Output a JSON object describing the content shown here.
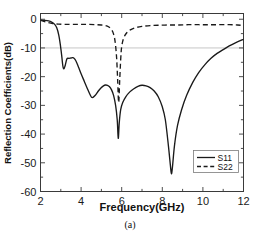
{
  "figure": {
    "caption": "(a)",
    "background": "#ffffff",
    "line_color": "#1a1a1a",
    "grid_color": "#b9b9b9",
    "axis_color": "#3a3a3a"
  },
  "chart_data": {
    "type": "line",
    "title": "",
    "xlabel": "Frequency(GHz)",
    "ylabel": "Reflection Coefficients(dB)",
    "xlim": [
      2,
      12
    ],
    "ylim": [
      -60,
      2
    ],
    "xticks": [
      2,
      4,
      6,
      8,
      10,
      12
    ],
    "xtick_labels": [
      "2",
      "4",
      "6",
      "8",
      "10",
      "12"
    ],
    "xminor_ticks": [
      3,
      5,
      7,
      9,
      11
    ],
    "yticks": [
      0,
      -10,
      -20,
      -30,
      -40,
      -50,
      -60
    ],
    "ytick_labels": [
      "0",
      "-10",
      "-20",
      "-30",
      "-40",
      "-50",
      "-60"
    ],
    "grid": "horizontal-single",
    "gridlines_y": [
      -10
    ],
    "legend_position": "lower right",
    "series": [
      {
        "name": "S11",
        "style": "solid",
        "x": [
          2.0,
          2.2,
          2.4,
          2.55,
          2.7,
          2.8,
          2.9,
          2.98,
          3.05,
          3.1,
          3.15,
          3.22,
          3.3,
          3.4,
          3.5,
          3.6,
          3.7,
          3.8,
          3.9,
          4.0,
          4.15,
          4.3,
          4.45,
          4.55,
          4.7,
          4.85,
          5.0,
          5.1,
          5.2,
          5.3,
          5.4,
          5.5,
          5.6,
          5.7,
          5.78,
          5.83,
          5.88,
          5.95,
          6.05,
          6.2,
          6.4,
          6.6,
          6.8,
          7.0,
          7.2,
          7.4,
          7.6,
          7.8,
          8.0,
          8.15,
          8.3,
          8.4,
          8.45,
          8.5,
          8.6,
          8.75,
          8.95,
          9.2,
          9.5,
          9.8,
          10.1,
          10.4,
          10.7,
          11.0,
          11.3,
          11.6,
          12.0
        ],
        "y": [
          -0.3,
          -0.4,
          -0.6,
          -1.0,
          -1.8,
          -3.0,
          -5.5,
          -9.0,
          -13.0,
          -16.2,
          -17.3,
          -16.0,
          -13.8,
          -13.6,
          -13.5,
          -13.4,
          -14.0,
          -15.4,
          -17.2,
          -19.0,
          -21.5,
          -24.0,
          -26.4,
          -27.3,
          -26.5,
          -25.0,
          -23.8,
          -23.2,
          -22.9,
          -23.0,
          -23.5,
          -24.6,
          -26.5,
          -30.0,
          -35.0,
          -41.5,
          -36.0,
          -31.5,
          -29.0,
          -27.0,
          -25.3,
          -24.2,
          -23.4,
          -23.0,
          -23.2,
          -23.8,
          -25.0,
          -27.0,
          -30.5,
          -35.0,
          -44.0,
          -51.0,
          -53.8,
          -51.5,
          -44.0,
          -37.0,
          -31.5,
          -26.5,
          -22.0,
          -18.5,
          -15.8,
          -13.6,
          -11.9,
          -10.6,
          -9.3,
          -8.2,
          -7.0
        ],
        "minima": [
          {
            "frequency": 3.15,
            "value": -17.3
          },
          {
            "frequency": 4.55,
            "value": -27.3
          },
          {
            "frequency": 5.83,
            "value": -41.5
          },
          {
            "frequency": 8.45,
            "value": -53.8
          }
        ]
      },
      {
        "name": "S22",
        "style": "dashed",
        "x": [
          2.0,
          2.3,
          2.6,
          2.9,
          3.2,
          3.6,
          4.0,
          4.4,
          4.8,
          5.0,
          5.2,
          5.35,
          5.5,
          5.6,
          5.68,
          5.75,
          5.8,
          5.85,
          5.9,
          5.95,
          6.0,
          6.1,
          6.25,
          6.45,
          6.7,
          7.0,
          7.4,
          7.8,
          8.3,
          8.8,
          9.3,
          9.8,
          10.3,
          10.8,
          11.3,
          11.7,
          12.0
        ],
        "y": [
          -0.4,
          -1.0,
          -1.5,
          -1.7,
          -1.8,
          -1.8,
          -1.8,
          -1.8,
          -1.9,
          -2.0,
          -2.2,
          -2.6,
          -3.6,
          -5.2,
          -8.0,
          -13.5,
          -21.0,
          -29.0,
          -21.5,
          -14.0,
          -9.5,
          -6.5,
          -4.7,
          -3.6,
          -2.9,
          -2.5,
          -2.2,
          -2.1,
          -2.0,
          -2.0,
          -1.9,
          -1.9,
          -1.9,
          -1.9,
          -1.9,
          -2.0,
          -2.2
        ],
        "minima": [
          {
            "frequency": 5.85,
            "value": -29.0
          }
        ]
      }
    ],
    "legend": [
      {
        "label": "S11",
        "style": "solid"
      },
      {
        "label": "S22",
        "style": "dashed"
      }
    ]
  }
}
